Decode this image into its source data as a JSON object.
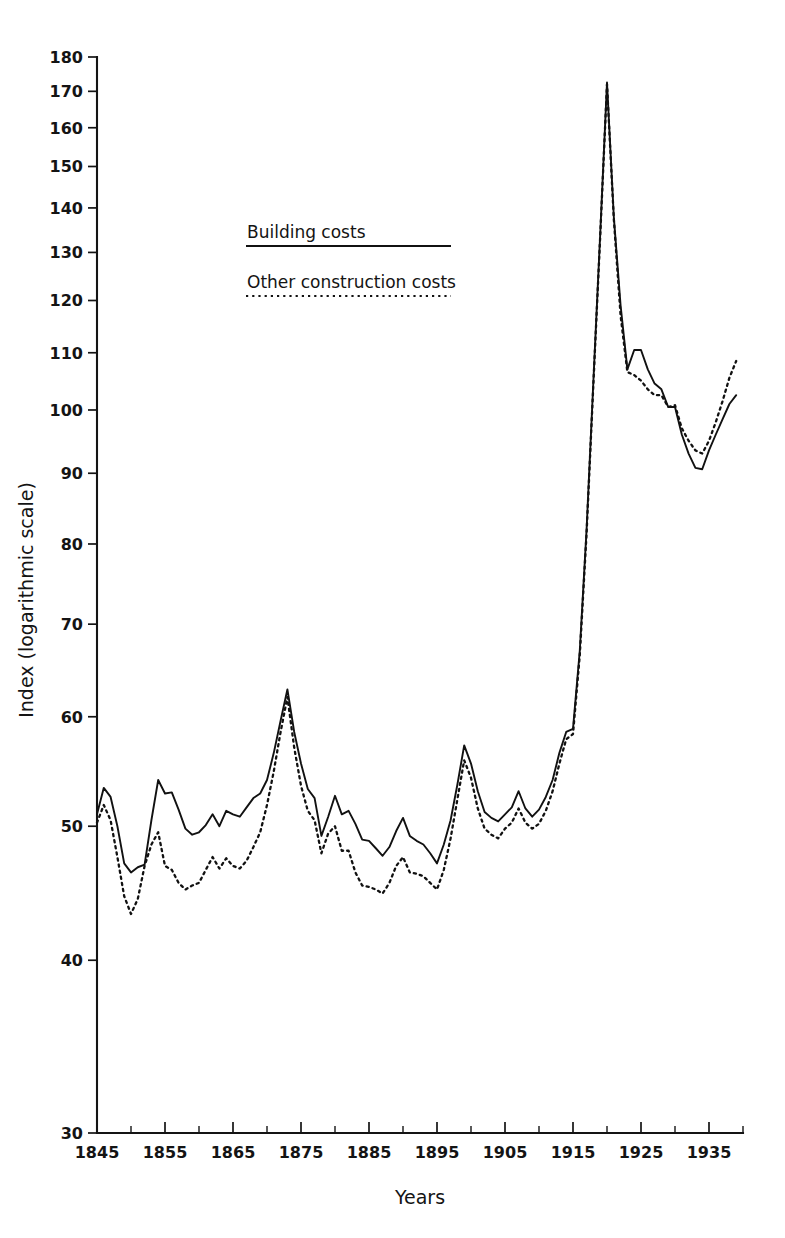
{
  "chart_data": {
    "type": "line",
    "title": "",
    "xlabel": "Years",
    "ylabel": "Index (logarithmic scale)",
    "yscale": "log",
    "grid": false,
    "legend_position": "upper-left-inside",
    "xlim": [
      1845,
      1940
    ],
    "ylim": [
      30,
      180
    ],
    "x_major_ticks": [
      1845,
      1855,
      1865,
      1875,
      1885,
      1895,
      1905,
      1915,
      1925,
      1935
    ],
    "x_major_tick_labels": [
      "1845",
      "1855",
      "1865",
      "1875",
      "1885",
      "1895",
      "1905",
      "1915",
      "1925",
      "1935"
    ],
    "x_minor_tick_interval": 5,
    "y_major_ticks": [
      30,
      40,
      50,
      60,
      70,
      80,
      90,
      100,
      110,
      120,
      130,
      140,
      150,
      160,
      170,
      180
    ],
    "y_major_tick_labels": [
      "30",
      "40",
      "50",
      "60",
      "70",
      "80",
      "90",
      "100",
      "110",
      "120",
      "130",
      "140",
      "150",
      "160",
      "170",
      "180"
    ],
    "x": [
      1845,
      1846,
      1847,
      1848,
      1849,
      1850,
      1851,
      1852,
      1853,
      1854,
      1855,
      1856,
      1857,
      1858,
      1859,
      1860,
      1861,
      1862,
      1863,
      1864,
      1865,
      1866,
      1867,
      1868,
      1869,
      1870,
      1871,
      1872,
      1873,
      1874,
      1875,
      1876,
      1877,
      1878,
      1879,
      1880,
      1881,
      1882,
      1883,
      1884,
      1885,
      1886,
      1887,
      1888,
      1889,
      1890,
      1891,
      1892,
      1893,
      1894,
      1895,
      1896,
      1897,
      1898,
      1899,
      1900,
      1901,
      1902,
      1903,
      1904,
      1905,
      1906,
      1907,
      1908,
      1909,
      1910,
      1911,
      1912,
      1913,
      1914,
      1915,
      1916,
      1917,
      1918,
      1919,
      1920,
      1921,
      1922,
      1923,
      1924,
      1925,
      1926,
      1927,
      1928,
      1929,
      1930,
      1931,
      1932,
      1933,
      1934,
      1935,
      1936,
      1937,
      1938,
      1939
    ],
    "series": [
      {
        "name": "Building costs",
        "style": "solid",
        "values": [
          51.0,
          53.3,
          52.5,
          50.0,
          47.0,
          46.3,
          46.7,
          46.9,
          50.5,
          54.0,
          52.8,
          52.9,
          51.4,
          49.8,
          49.3,
          49.5,
          50.1,
          51.0,
          50.0,
          51.3,
          51.0,
          50.8,
          51.6,
          52.4,
          52.8,
          54.0,
          56.5,
          59.6,
          62.8,
          58.5,
          55.5,
          53.2,
          52.4,
          49.2,
          50.8,
          52.6,
          51.0,
          51.3,
          50.2,
          48.9,
          48.8,
          48.2,
          47.6,
          48.3,
          49.6,
          50.7,
          49.2,
          48.8,
          48.5,
          47.8,
          47.0,
          48.5,
          50.5,
          53.6,
          57.2,
          55.5,
          53.0,
          51.2,
          50.7,
          50.4,
          51.0,
          51.6,
          53.0,
          51.5,
          50.8,
          51.4,
          52.5,
          54.0,
          56.5,
          58.5,
          58.8,
          67.0,
          82.0,
          105.0,
          134.0,
          172.5,
          138.0,
          119.0,
          107.0,
          110.5,
          110.5,
          107.0,
          104.5,
          103.5,
          100.5,
          100.5,
          96.0,
          93.0,
          90.8,
          90.6,
          93.5,
          96.0,
          98.5,
          101.0,
          102.5
        ]
      },
      {
        "name": "Other construction costs",
        "style": "dotted",
        "values": [
          50.3,
          51.8,
          50.5,
          47.5,
          44.5,
          43.2,
          44.3,
          46.8,
          48.5,
          49.5,
          46.8,
          46.5,
          45.5,
          45.0,
          45.3,
          45.5,
          46.5,
          47.5,
          46.6,
          47.4,
          46.8,
          46.6,
          47.2,
          48.3,
          49.5,
          51.8,
          54.8,
          58.5,
          62.0,
          57.0,
          53.5,
          51.3,
          50.5,
          47.8,
          49.4,
          50.0,
          48.0,
          48.0,
          46.3,
          45.3,
          45.2,
          45.0,
          44.7,
          45.5,
          46.8,
          47.5,
          46.3,
          46.2,
          46.0,
          45.5,
          45.0,
          46.5,
          49.0,
          52.3,
          55.8,
          54.2,
          51.5,
          49.8,
          49.3,
          49.0,
          49.8,
          50.3,
          51.5,
          50.3,
          49.8,
          50.2,
          51.3,
          53.0,
          55.5,
          57.8,
          58.3,
          66.5,
          81.5,
          104.5,
          133.5,
          172.0,
          137.5,
          117.0,
          106.5,
          106.0,
          105.0,
          103.5,
          102.5,
          102.5,
          100.5,
          100.8,
          97.0,
          95.0,
          93.5,
          93.0,
          95.0,
          98.0,
          101.5,
          105.5,
          108.5
        ]
      }
    ]
  },
  "axes": {
    "y_axis_title": "Index (logarithmic scale)",
    "x_axis_title": "Years"
  },
  "legend": {
    "items": [
      {
        "label": "Building costs",
        "style": "solid"
      },
      {
        "label": "Other construction costs",
        "style": "dotted"
      }
    ]
  }
}
